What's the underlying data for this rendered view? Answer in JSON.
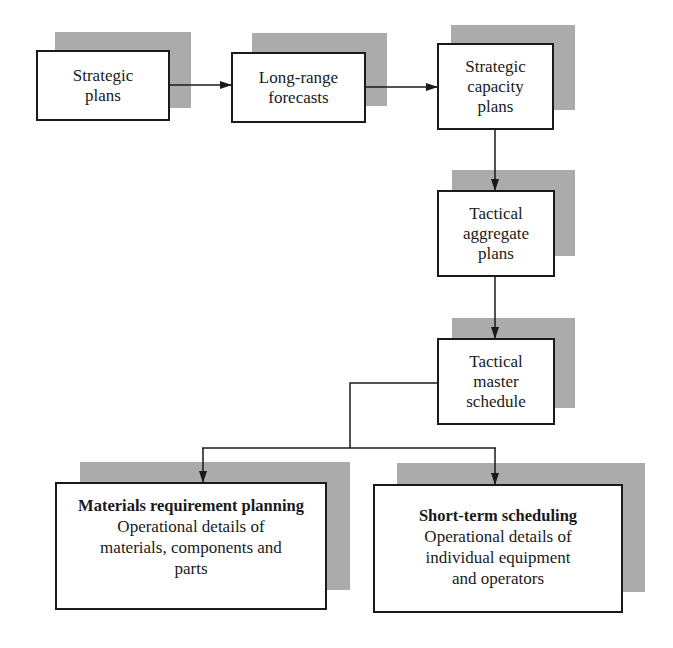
{
  "diagram": {
    "nodes": [
      {
        "id": "strategic-plans",
        "lines": [
          "Strategic",
          "plans"
        ]
      },
      {
        "id": "long-range-forecasts",
        "lines": [
          "Long-range",
          "forecasts"
        ]
      },
      {
        "id": "strategic-capacity-plans",
        "lines": [
          "Strategic",
          "capacity",
          "plans"
        ]
      },
      {
        "id": "tactical-aggregate-plans",
        "lines": [
          "Tactical",
          "aggregate",
          "plans"
        ]
      },
      {
        "id": "tactical-master-schedule",
        "lines": [
          "Tactical",
          "master",
          "schedule"
        ]
      },
      {
        "id": "materials-requirement-planning",
        "title": "Materials requirement planning",
        "lines": [
          "Operational details of",
          "materials, components and",
          "parts"
        ]
      },
      {
        "id": "short-term-scheduling",
        "title": "Short-term scheduling",
        "lines": [
          "Operational details of",
          "individual equipment",
          "and operators"
        ]
      }
    ],
    "edges": [
      {
        "from": "strategic-plans",
        "to": "long-range-forecasts"
      },
      {
        "from": "long-range-forecasts",
        "to": "strategic-capacity-plans"
      },
      {
        "from": "strategic-capacity-plans",
        "to": "tactical-aggregate-plans"
      },
      {
        "from": "tactical-aggregate-plans",
        "to": "tactical-master-schedule"
      },
      {
        "from": "tactical-master-schedule",
        "to": "materials-requirement-planning"
      },
      {
        "from": "tactical-master-schedule",
        "to": "short-term-scheduling"
      }
    ],
    "colors": {
      "line": "#1a1a1a",
      "shadow": "#c9c9c9",
      "box_fill": "#ffffff"
    }
  }
}
